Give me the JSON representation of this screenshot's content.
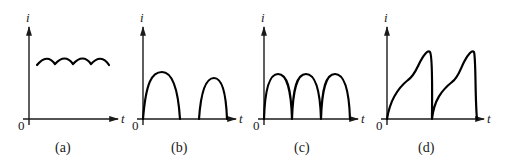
{
  "figure": {
    "axis_labels": {
      "y": "i",
      "x": "t",
      "origin": "0"
    },
    "panels": [
      {
        "id": "a",
        "caption": "(a)",
        "description": "Small ripple on a large DC level (filtered current)"
      },
      {
        "id": "b",
        "caption": "(b)",
        "description": "Intermittent half-sine pulses (discontinuous conduction)"
      },
      {
        "id": "c",
        "caption": "(c)",
        "description": "Consecutive half-sine pulses (full-wave rectified, continuous)"
      },
      {
        "id": "d",
        "caption": "(d)",
        "description": "Sawtooth-like pulses with rising shoulder and steep fall"
      }
    ]
  },
  "colors": {
    "ink": "#000000",
    "background": "#ffffff"
  }
}
